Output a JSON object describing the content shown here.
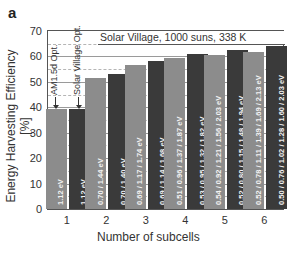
{
  "panel_label": "a",
  "chart_data": {
    "type": "bar",
    "title": "Solar Village, 1000 suns, 338 K",
    "xlabel": "Number of subcells",
    "ylabel": "Energy Harvesting Efficiency [%]",
    "ylim": [
      0,
      70
    ],
    "yticks": [
      0,
      10,
      20,
      30,
      40,
      50,
      60,
      70
    ],
    "grid": true,
    "categories": [
      "1",
      "2",
      "3",
      "4",
      "5",
      "6"
    ],
    "series": [
      {
        "name": "AM1.5d Opt.",
        "color": "#8c8c8c",
        "values": [
          39.5,
          51.7,
          56.8,
          59.5,
          60.7,
          61.9
        ],
        "labels": [
          "1.12 eV",
          "0.70 / 1.44 eV",
          "0.69 / 1.17 / 1.74 eV",
          "0.51 / 0.96 / 1.37 / 1.87 eV",
          "0.54 / 0.92 / 1.21 / 1.56 / 2.03 eV",
          "0.52 / 0.78 / 1.11 / 1.39 / 1.69 / 2.13 eV"
        ]
      },
      {
        "name": "Solar Village Opt.",
        "color": "#3a3a3a",
        "values": [
          39.5,
          52.9,
          58.3,
          61.1,
          62.6,
          64.2
        ],
        "labels": [
          "1.12 eV",
          "0.70 / 1.40 eV",
          "0.69 / 1.14 / 1.68 eV",
          "0.53 / 0.95 / 1.32 / 1.82 eV",
          "0.52 / 0.80 / 1.15 / 1.48 / 1.94 eV",
          "0.50 / 0.76 / 1.02 / 1.28 / 1.60 / 2.03 eV"
        ]
      }
    ],
    "annotations": [
      "AM1.5d Opt.",
      "Solar Village Opt."
    ],
    "legend": "none (annotations with arrows on first group)"
  },
  "ytick_labels": [
    "0",
    "10",
    "20",
    "30",
    "40",
    "50",
    "60",
    "70"
  ],
  "xtick_labels": [
    "1",
    "2",
    "3",
    "4",
    "5",
    "6"
  ]
}
